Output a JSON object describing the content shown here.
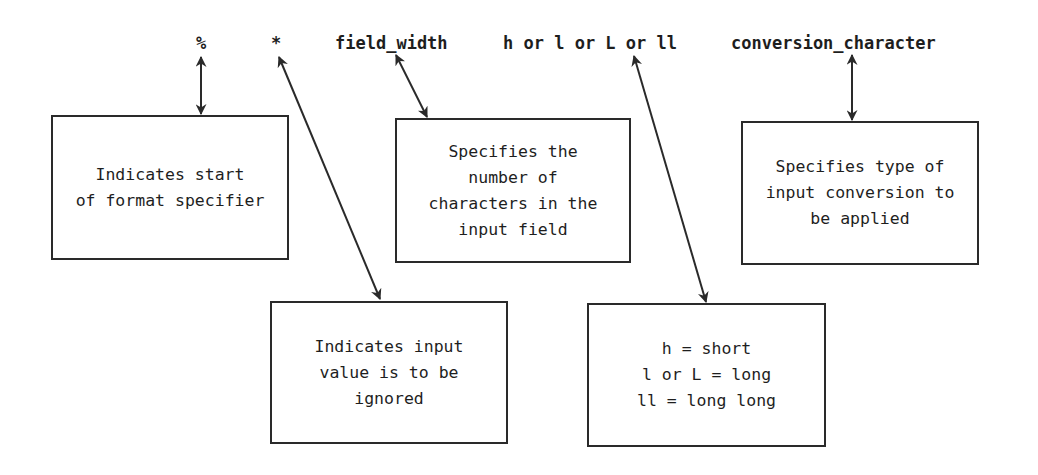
{
  "diagram": {
    "headers": {
      "percent": "%",
      "asterisk": "*",
      "field_width": "field_width",
      "length_modifier": "h or l or L or ll",
      "conversion_character": "conversion_character"
    },
    "boxes": {
      "percent": "Indicates start\nof format specifier",
      "asterisk": "Indicates input\nvalue is to be\nignored",
      "field_width": "Specifies the\nnumber of\ncharacters in the\ninput field",
      "length_modifier": "h = short\nl or L = long\nll = long long",
      "conversion_character": "Specifies type of\ninput conversion to\nbe applied"
    },
    "colors": {
      "line": "#2a2a2a",
      "text": "#1e1e1e",
      "background": "#ffffff"
    }
  }
}
